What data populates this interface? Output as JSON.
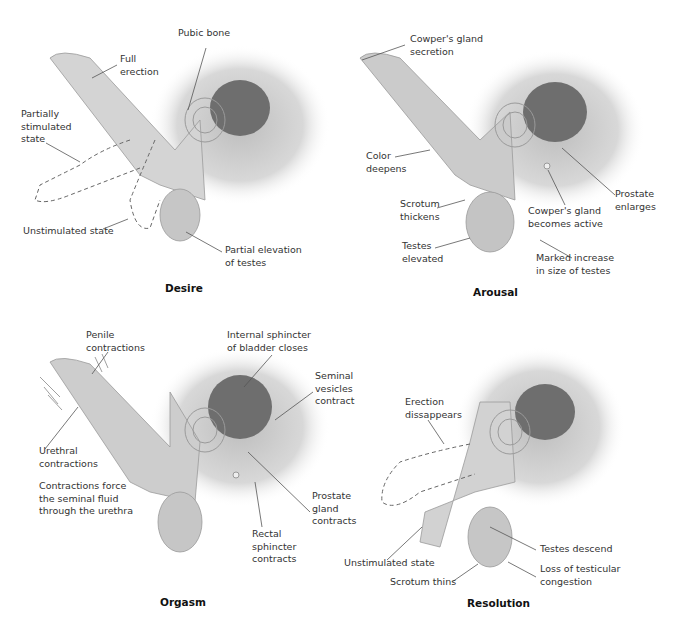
{
  "figure": {
    "colors": {
      "tissue": "#d4d4d4",
      "tissue_edge": "#9a9a9a",
      "shadow": "#b8b8b8",
      "organ_dark": "#6e6e6e",
      "leader": "#555555",
      "text": "#333333"
    }
  },
  "panels": [
    {
      "title": "Desire",
      "labels": [
        {
          "text": "Pubic bone"
        },
        {
          "text": "Full\nerection"
        },
        {
          "text": "Partially\nstimulated\nstate"
        },
        {
          "text": "Unstimulated state"
        },
        {
          "text": "Partial elevation\nof testes"
        }
      ]
    },
    {
      "title": "Arousal",
      "labels": [
        {
          "text": "Cowper's gland\nsecretion"
        },
        {
          "text": "Color\ndeepens"
        },
        {
          "text": "Scrotum\nthickens"
        },
        {
          "text": "Testes\nelevated"
        },
        {
          "text": "Cowper's gland\nbecomes active"
        },
        {
          "text": "Prostate\nenlarges"
        },
        {
          "text": "Marked increase\nin size of testes"
        }
      ]
    },
    {
      "title": "Orgasm",
      "labels": [
        {
          "text": "Penile\ncontractions"
        },
        {
          "text": "Internal sphincter\nof bladder closes"
        },
        {
          "text": "Seminal\nvesicles\ncontract"
        },
        {
          "text": "Urethral\ncontractions"
        },
        {
          "text": "Contractions force\nthe seminal fluid\nthrough the urethra"
        },
        {
          "text": "Prostate\ngland\ncontracts"
        },
        {
          "text": "Rectal\nsphincter\ncontracts"
        }
      ]
    },
    {
      "title": "Resolution",
      "labels": [
        {
          "text": "Erection\ndissappears"
        },
        {
          "text": "Unstimulated state"
        },
        {
          "text": "Scrotum thins"
        },
        {
          "text": "Testes descend"
        },
        {
          "text": "Loss of testicular\ncongestion"
        }
      ]
    }
  ]
}
